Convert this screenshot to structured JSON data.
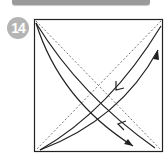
{
  "header": {
    "bar_color": "#9a9a9a"
  },
  "step": {
    "number": "14",
    "badge_color": "#b4b4b4"
  },
  "diagram": {
    "square": {
      "x": 34,
      "y": 19,
      "width": 129,
      "height": 132
    },
    "line_color": "#222222",
    "dash_color": "#555555",
    "icons": [
      "fold-arrow-icon",
      "unfold-arrow-icon"
    ]
  }
}
